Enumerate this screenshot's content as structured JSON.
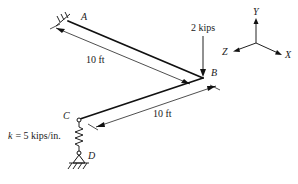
{
  "figure": {
    "points": {
      "A": "A",
      "B": "B",
      "C": "C",
      "D": "D"
    },
    "load": {
      "label": "2 kips",
      "direction": "downward",
      "applied_at": "B"
    },
    "dimensions": {
      "AB": "10 ft",
      "BC": "10 ft"
    },
    "spring": {
      "label": "k = 5 kips/in.",
      "k_symbol": "k",
      "value_text": "= 5 kips/in."
    },
    "axes": {
      "x": "X",
      "y": "Y",
      "z": "Z"
    },
    "supports": {
      "A": "fixed",
      "D": "pinned ground"
    }
  }
}
